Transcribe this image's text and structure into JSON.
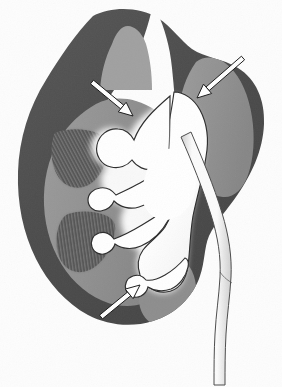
{
  "figure": {
    "title": "Kidney coronal section",
    "subject": "kidney",
    "view": "coronal cross-section",
    "rendering": "grayscale medical illustration",
    "background_color": "#fdfdfd",
    "width": 282,
    "height": 387
  },
  "palette": {
    "background": "#fdfdfd",
    "cortex_dark": "#4c4c4c",
    "cortex_dark_edge": "#565656",
    "medulla_mid": "#8f8f8f",
    "medulla_light": "#a8a8a8",
    "pyramid_dark": "#5a5a5a",
    "pyramid_stripe": "#7d7d7d",
    "calyx_lumen": "#ffffff",
    "calyx_halo": "#d8d8d8",
    "outline": "#2b2b2b",
    "ureter_fill": "#fafafa",
    "ureter_wall": "#bdbdbd",
    "arrow_stroke": "#1a1a1a",
    "arrow_fill": "#ffffff"
  },
  "structures": [
    {
      "id": "renal-capsule-cortex",
      "label": "Renal cortex (dark outer zone)",
      "tone": "#4c4c4c"
    },
    {
      "id": "renal-medulla",
      "label": "Renal medulla (mid gray zone)",
      "tone": "#8f8f8f"
    },
    {
      "id": "renal-pyramid-upper",
      "label": "Renal pyramid, upper (striated)",
      "tone": "#5a5a5a"
    },
    {
      "id": "renal-pyramid-lower",
      "label": "Renal pyramid, lower (striated)",
      "tone": "#5a5a5a"
    },
    {
      "id": "renal-column",
      "label": "Renal column",
      "tone": "#8f8f8f"
    },
    {
      "id": "minor-calyx-upper",
      "label": "Dilated minor calyx, upper pole",
      "tone": "#ffffff"
    },
    {
      "id": "minor-calyx-middle",
      "label": "Dilated minor calyx, mid pole",
      "tone": "#ffffff"
    },
    {
      "id": "minor-calyx-lower",
      "label": "Dilated minor calyx, lower pole",
      "tone": "#ffffff"
    },
    {
      "id": "renal-pelvis",
      "label": "Renal pelvis",
      "tone": "#ffffff"
    },
    {
      "id": "ureter",
      "label": "Ureter",
      "tone": "#fafafa"
    },
    {
      "id": "lower-pole-lobe",
      "label": "Lower pole parenchymal lobe",
      "tone": "#4c4c4c"
    }
  ],
  "annotations": {
    "arrows": [
      {
        "id": "arrow-upper-left",
        "name": "arrow-upper-left",
        "style": "outlined",
        "direction": "down-right",
        "points_to": "minor-calyx-upper",
        "tail": {
          "x": 92,
          "y": 82
        },
        "head": {
          "x": 133,
          "y": 116
        }
      },
      {
        "id": "arrow-upper-right",
        "name": "arrow-upper-right",
        "style": "outlined",
        "direction": "down-left",
        "points_to": "renal-pelvis",
        "tail": {
          "x": 243,
          "y": 58
        },
        "head": {
          "x": 197,
          "y": 98
        }
      },
      {
        "id": "arrow-lower-left",
        "name": "arrow-lower-left",
        "style": "outlined",
        "direction": "up-right",
        "points_to": "minor-calyx-lower",
        "tail": {
          "x": 101,
          "y": 317
        },
        "head": {
          "x": 140,
          "y": 285
        }
      }
    ],
    "labels": [],
    "caption": ""
  }
}
